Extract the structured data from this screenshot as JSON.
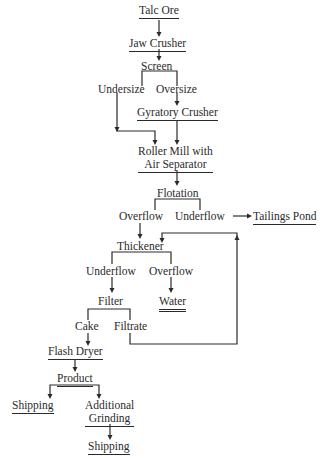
{
  "diagram": {
    "nodes": {
      "talc_ore": "Talc Ore",
      "jaw_crusher": "Jaw Crusher",
      "screen": "Screen",
      "undersize": "Undersize",
      "oversize": "Oversize",
      "gyratory_crusher": "Gyratory Crusher",
      "roller_mill_1": "Roller Mill with",
      "roller_mill_2": "Air Separator",
      "flotation": "Flotation",
      "flotation_overflow": "Overflow",
      "flotation_underflow": "Underflow",
      "tailings_pond": "Tailings Pond",
      "thickener": "Thickener",
      "thickener_underflow": "Underflow",
      "thickener_overflow": "Overflow",
      "filter": "Filter",
      "water": "Water",
      "cake": "Cake",
      "filtrate": "Filtrate",
      "flash_dryer": "Flash Dryer",
      "product": "Product",
      "shipping_1": "Shipping",
      "additional_grinding_1": "Additional",
      "additional_grinding_2": "Grinding",
      "shipping_2": "Shipping"
    },
    "edges": [
      [
        "Talc Ore",
        "Jaw Crusher"
      ],
      [
        "Jaw Crusher",
        "Screen"
      ],
      [
        "Screen",
        "Undersize"
      ],
      [
        "Screen",
        "Oversize"
      ],
      [
        "Oversize",
        "Gyratory Crusher"
      ],
      [
        "Undersize",
        "Roller Mill with Air Separator"
      ],
      [
        "Gyratory Crusher",
        "Roller Mill with Air Separator"
      ],
      [
        "Roller Mill with Air Separator",
        "Flotation"
      ],
      [
        "Flotation",
        "Overflow"
      ],
      [
        "Flotation",
        "Underflow"
      ],
      [
        "Underflow",
        "Tailings Pond"
      ],
      [
        "Overflow",
        "Thickener"
      ],
      [
        "Thickener",
        "Underflow"
      ],
      [
        "Thickener",
        "Overflow"
      ],
      [
        "Underflow",
        "Filter"
      ],
      [
        "Overflow",
        "Water"
      ],
      [
        "Filter",
        "Cake"
      ],
      [
        "Filter",
        "Filtrate"
      ],
      [
        "Filtrate",
        "Thickener"
      ],
      [
        "Cake",
        "Flash Dryer"
      ],
      [
        "Flash Dryer",
        "Product"
      ],
      [
        "Product",
        "Shipping"
      ],
      [
        "Product",
        "Additional Grinding"
      ],
      [
        "Additional Grinding",
        "Shipping"
      ]
    ]
  }
}
